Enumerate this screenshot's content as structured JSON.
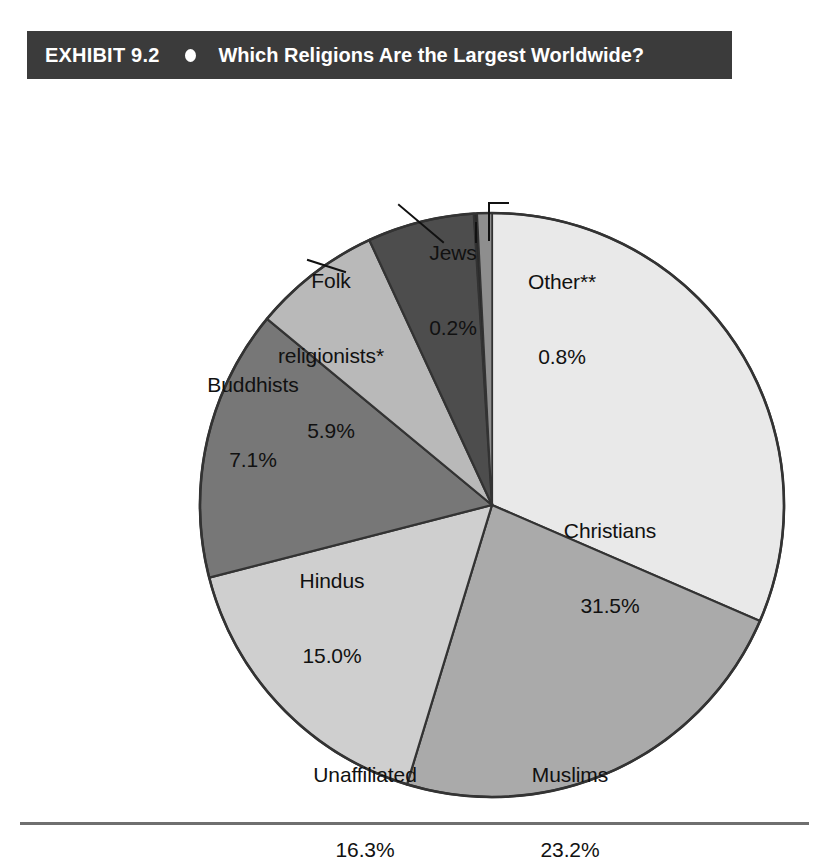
{
  "banner": {
    "exhibit_label": "EXHIBIT 9.2",
    "bullet_icon": "filled-circle-icon",
    "title": "Which Religions Are the Largest Worldwide?"
  },
  "chart_data": {
    "type": "pie",
    "title": "Which Religions Are the Largest Worldwide?",
    "xlabel": "",
    "ylabel": "",
    "legend_position": "none",
    "grid": false,
    "value_unit": "percent",
    "start_angle_deg": -90,
    "direction": "clockwise",
    "categories": [
      "Christians",
      "Muslims",
      "Unaffiliated",
      "Hindus",
      "Buddhists",
      "Folk religionists*",
      "Jews",
      "Other**"
    ],
    "values": [
      31.5,
      23.2,
      16.3,
      15.0,
      7.1,
      5.9,
      0.2,
      0.8
    ],
    "slices": [
      {
        "label": "Christians",
        "value": 31.5,
        "display": "31.5%",
        "color": "#e9e9e9",
        "label_placement": "inside"
      },
      {
        "label": "Muslims",
        "value": 23.2,
        "display": "23.2%",
        "color": "#aaaaaa",
        "label_placement": "inside"
      },
      {
        "label": "Unaffiliated",
        "value": 16.3,
        "display": "16.3%",
        "color": "#cfcfcf",
        "label_placement": "inside"
      },
      {
        "label": "Hindus",
        "value": 15.0,
        "display": "15.0%",
        "color": "#777777",
        "label_placement": "inside"
      },
      {
        "label": "Buddhists",
        "value": 7.1,
        "display": "7.1%",
        "color": "#b9b9b9",
        "label_placement": "outside-leader"
      },
      {
        "label": "Folk religionists*",
        "value": 5.9,
        "display": "5.9%",
        "color": "#4d4d4d",
        "label_placement": "outside-leader"
      },
      {
        "label": "Jews",
        "value": 0.2,
        "display": "0.2%",
        "color": "#2b2b2b",
        "label_placement": "outside-leader"
      },
      {
        "label": "Other**",
        "value": 0.8,
        "display": "0.8%",
        "color": "#8e8e8e",
        "label_placement": "outside-leader"
      }
    ]
  },
  "labels": {
    "christians": {
      "name": "Christians",
      "value": "31.5%"
    },
    "muslims": {
      "name": "Muslims",
      "value": "23.2%"
    },
    "unaffiliated": {
      "name": "Unaffiliated",
      "value": "16.3%"
    },
    "hindus": {
      "name": "Hindus",
      "value": "15.0%"
    },
    "buddhists": {
      "name": "Buddhists",
      "value": "7.1%"
    },
    "folk": {
      "line1": "Folk",
      "line2": "religionists*",
      "value": "5.9%"
    },
    "jews": {
      "name": "Jews",
      "value": "0.2%"
    },
    "other": {
      "name": "Other**",
      "value": "0.8%"
    }
  },
  "colors": {
    "banner_background": "#3b3b3b",
    "banner_text": "#ffffff",
    "page_background": "#ffffff",
    "label_text": "#111111",
    "slice_outline": "#333333",
    "rule": "#6f6f6f"
  }
}
